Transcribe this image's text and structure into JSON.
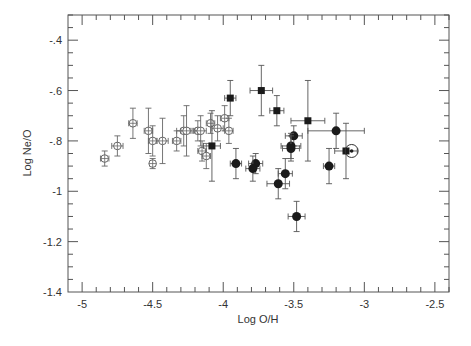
{
  "chart_data": {
    "type": "scatter",
    "title": "",
    "xlabel": "Log O/H",
    "ylabel": "Log Ne/O",
    "xlim": [
      -5.1,
      -2.4
    ],
    "ylim": [
      -1.4,
      -0.3
    ],
    "xticks": [
      -5,
      -4.5,
      -4,
      -3.5,
      -3,
      -2.5
    ],
    "xtick_labels": [
      "-5",
      "-4.5",
      "-4",
      "-3.5",
      "-3",
      "-2.5"
    ],
    "yticks": [
      -0.4,
      -0.6,
      -0.8,
      -1.0,
      -1.2,
      -1.4
    ],
    "ytick_labels": [
      "-.4",
      "-.6",
      "-.8",
      "-1",
      "-1.2",
      "-1.4"
    ],
    "x_minor_step": 0.1,
    "y_minor_step": 0.05,
    "grid": false,
    "legend": null,
    "series": [
      {
        "name": "open-circles",
        "marker": "open-circle-cross",
        "points": [
          {
            "x": -4.84,
            "y": -0.87,
            "xerr": 0.03,
            "yerr": 0.03
          },
          {
            "x": -4.75,
            "y": -0.82,
            "xerr": 0.04,
            "yerr": 0.04
          },
          {
            "x": -4.64,
            "y": -0.73,
            "xerr": 0.03,
            "yerr": 0.06
          },
          {
            "x": -4.53,
            "y": -0.76,
            "xerr": 0.03,
            "yerr": 0.09
          },
          {
            "x": -4.5,
            "y": -0.8,
            "xerr": 0.03,
            "yerr": 0.06
          },
          {
            "x": -4.43,
            "y": -0.8,
            "xerr": 0.04,
            "yerr": 0.09
          },
          {
            "x": -4.5,
            "y": -0.89,
            "xerr": 0.02,
            "yerr": 0.02
          },
          {
            "x": -4.33,
            "y": -0.8,
            "xerr": 0.03,
            "yerr": 0.04
          },
          {
            "x": -4.28,
            "y": -0.76,
            "xerr": 0.05,
            "yerr": 0.06
          },
          {
            "x": -4.26,
            "y": -0.76,
            "xerr": 0.04,
            "yerr": 0.1
          },
          {
            "x": -4.18,
            "y": -0.76,
            "xerr": 0.03,
            "yerr": 0.04
          },
          {
            "x": -4.16,
            "y": -0.76,
            "xerr": 0.04,
            "yerr": 0.06
          },
          {
            "x": -4.15,
            "y": -0.84,
            "xerr": 0.03,
            "yerr": 0.04
          },
          {
            "x": -4.12,
            "y": -0.86,
            "xerr": 0.03,
            "yerr": 0.05
          },
          {
            "x": -4.09,
            "y": -0.73,
            "xerr": 0.03,
            "yerr": 0.04
          },
          {
            "x": -4.04,
            "y": -0.75,
            "xerr": 0.04,
            "yerr": 0.05
          },
          {
            "x": -3.99,
            "y": -0.71,
            "xerr": 0.03,
            "yerr": 0.05
          },
          {
            "x": -3.96,
            "y": -0.76,
            "xerr": 0.03,
            "yerr": 0.05
          }
        ]
      },
      {
        "name": "filled-squares",
        "marker": "filled-square",
        "points": [
          {
            "x": -4.08,
            "y": -0.82,
            "xerr": 0.06,
            "yerr": 0.14
          },
          {
            "x": -3.95,
            "y": -0.63,
            "xerr": 0.04,
            "yerr": 0.07
          },
          {
            "x": -3.73,
            "y": -0.6,
            "xerr": 0.08,
            "yerr": 0.1
          },
          {
            "x": -3.62,
            "y": -0.68,
            "xerr": 0.05,
            "yerr": 0.06
          },
          {
            "x": -3.4,
            "y": -0.72,
            "xerr": 0.12,
            "yerr": 0.16
          },
          {
            "x": -3.13,
            "y": -0.84,
            "xerr": 0.08,
            "yerr": 0.11
          }
        ]
      },
      {
        "name": "filled-circles",
        "marker": "filled-circle",
        "points": [
          {
            "x": -3.91,
            "y": -0.89,
            "xerr": 0.04,
            "yerr": 0.06
          },
          {
            "x": -3.77,
            "y": -0.89,
            "xerr": 0.05,
            "yerr": 0.04
          },
          {
            "x": -3.79,
            "y": -0.91,
            "xerr": 0.05,
            "yerr": 0.05
          },
          {
            "x": -3.5,
            "y": -0.78,
            "xerr": 0.06,
            "yerr": 0.04
          },
          {
            "x": -3.52,
            "y": -0.82,
            "xerr": 0.07,
            "yerr": 0.05
          },
          {
            "x": -3.52,
            "y": -0.83,
            "xerr": 0.06,
            "yerr": 0.05
          },
          {
            "x": -3.56,
            "y": -0.93,
            "xerr": 0.05,
            "yerr": 0.06
          },
          {
            "x": -3.61,
            "y": -0.97,
            "xerr": 0.08,
            "yerr": 0.06
          },
          {
            "x": -3.48,
            "y": -1.1,
            "xerr": 0.06,
            "yerr": 0.06
          },
          {
            "x": -3.2,
            "y": -0.76,
            "xerr": 0.2,
            "yerr": 0.07
          },
          {
            "x": -3.25,
            "y": -0.9,
            "xerr": 0.04,
            "yerr": 0.07
          }
        ]
      },
      {
        "name": "sun",
        "marker": "sun-symbol",
        "points": [
          {
            "x": -3.09,
            "y": -0.84,
            "xerr": 0,
            "yerr": 0
          }
        ]
      }
    ]
  },
  "colors": {
    "axis": "#555555",
    "marker": "#1a1a1a",
    "open_marker": "#666666",
    "errorbar": "#555555",
    "background": "#ffffff"
  }
}
